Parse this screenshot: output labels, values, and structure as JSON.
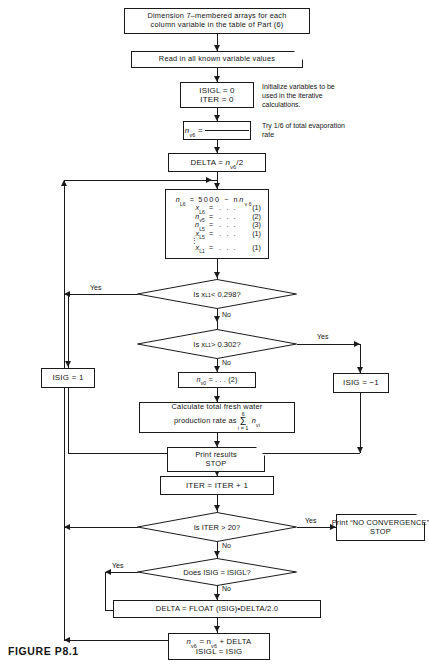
{
  "figure": {
    "caption": "FIGURE P8.1"
  },
  "nodes": {
    "dimension": {
      "name": "dimension-arrays-process",
      "line1": "Dimension 7–membered arrays for each",
      "line2": "column variable in the table of Part (6)"
    },
    "read_input": {
      "name": "read-input-io",
      "label": "Read in all known variable values"
    },
    "init_counters": {
      "name": "initialize-counters-process",
      "line1": "ISIGL = 0",
      "line2": "ITER = 0"
    },
    "guess_nv6": {
      "name": "guess-nv6-process",
      "lhs": "n",
      "sub": "v6",
      "eq": "="
    },
    "delta_init": {
      "name": "delta-init-process",
      "prefix": "DELTA = ",
      "lhs": "n",
      "sub": "v6",
      "suffix": "/2"
    },
    "equations": {
      "name": "compute-equations-process",
      "rows": [
        {
          "lhs": "n",
          "lhs_sub": "L6",
          "rhs": "5000 − n",
          "rhs_sub": "v6",
          "tag": ""
        },
        {
          "lhs": "x",
          "lhs_sub": "L6",
          "rhs": ". . .",
          "rhs_sub": "",
          "tag": "(1)"
        },
        {
          "lhs": "n",
          "lhs_sub": "v5",
          "rhs": ". . .",
          "rhs_sub": "",
          "tag": "(2)"
        },
        {
          "lhs": "n",
          "lhs_sub": "L5",
          "rhs": ". . .",
          "rhs_sub": "",
          "tag": "(3)"
        },
        {
          "lhs": "x",
          "lhs_sub": "L5",
          "rhs": ". . .",
          "rhs_sub": "",
          "tag": "(1)"
        },
        {
          "lhs": "",
          "lhs_sub": "",
          "rhs": "DOTS",
          "rhs_sub": "",
          "tag": ""
        },
        {
          "lhs": "x",
          "lhs_sub": "L1",
          "rhs": ". . .",
          "rhs_sub": "",
          "tag": "(1)"
        }
      ]
    },
    "test_low": {
      "name": "test-xl1-below-decision",
      "prefix": "Is  x",
      "sub": "L1",
      "suffix": " <  0.298?"
    },
    "test_high": {
      "name": "test-xl1-above-decision",
      "prefix": "Is  x",
      "sub": "L1",
      "suffix": " >  0.302?"
    },
    "isig_pos": {
      "name": "set-isig-positive-process",
      "label": "ISIG = 1"
    },
    "isig_neg": {
      "name": "set-isig-negative-process",
      "label": "ISIG = −1"
    },
    "nv0": {
      "name": "compute-nv0-process",
      "lhs": "n",
      "sub": "v0",
      "suffix": "= . . . (2)"
    },
    "calc_total": {
      "name": "calculate-total-fresh-water-process",
      "line1": "Calculate  total  fresh  water",
      "line2_pre": "production  rate  as ",
      "sum_top": "6",
      "sum_sigma": "Σ",
      "sum_bot": "i = 1",
      "line2_post_lhs": "n",
      "line2_post_sub": "vi"
    },
    "print_results": {
      "name": "print-results-io",
      "line1": "Print results",
      "line2": "STOP"
    },
    "iter_incr": {
      "name": "increment-iteration-process",
      "label": "ITER = ITER + 1"
    },
    "test_iter": {
      "name": "test-iteration-limit-decision",
      "label": "Is  ITER  >  20?"
    },
    "no_convergence": {
      "name": "print-no-convergence-io",
      "line1": "Print “NO CONVERGENCE”",
      "line2": "STOP"
    },
    "test_isig": {
      "name": "test-sign-change-decision",
      "label": "Does  ISIG = ISIGL?"
    },
    "halve_delta": {
      "name": "halve-delta-process",
      "label": "DELTA = FLOAT (ISIG)•DELTA/2.0"
    },
    "update_nv6": {
      "name": "update-nv6-process",
      "l1_lhs": "n",
      "l1_lhs_sub": "v6",
      "l1_mid": "=  n",
      "l1_mid_sub": "v6",
      "l1_end": " + DELTA",
      "line2": "ISIGL = ISIG"
    }
  },
  "annotations": {
    "initialize": "Initialize variables to be\nused in the iterative\ncalculations.",
    "try_sixth": "Try 1/6 of total evaporation\nrate"
  },
  "edge_labels": {
    "yes_low": "Yes",
    "no_low": "No",
    "yes_high": "Yes",
    "no_high": "No",
    "yes_iter": "Yes",
    "no_iter": "No",
    "yes_isig": "Yes",
    "no_isig": "No"
  },
  "colors": {
    "ink": "#141414",
    "paper": "#ffffff",
    "stroke": "#1a1a1a"
  }
}
